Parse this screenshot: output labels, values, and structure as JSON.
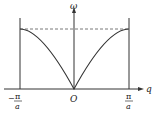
{
  "diagram": {
    "y_axis_label": "ω",
    "x_axis_label": "q",
    "origin_label": "O",
    "left_boundary": {
      "numerator": "π",
      "denominator": "a",
      "sign": "−"
    },
    "right_boundary": {
      "numerator": "π",
      "denominator": "a",
      "sign": ""
    },
    "curve": "ω ∝ |sin(qa/2)|",
    "max_line": "dashed horizontal at ω_max",
    "colors": {
      "line": "#333333",
      "dash": "#555555",
      "background": "#ffffff"
    }
  }
}
